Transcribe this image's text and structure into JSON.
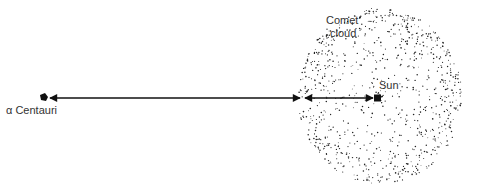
{
  "diagram": {
    "labels": {
      "alpha_centauri": "α Centauri",
      "sun": "Sun",
      "comet_line1": "Comet",
      "comet_line2": "cloud"
    },
    "objects": {
      "alpha_centauri": {
        "x": 44,
        "y": 98
      },
      "sun": {
        "x": 378,
        "y": 98
      },
      "cloud": {
        "cx": 380,
        "cy": 96,
        "rx": 82,
        "ry": 88
      }
    },
    "arrows": [
      {
        "name": "centauri-to-cloud",
        "from": [
          50,
          98
        ],
        "to": [
          300,
          98
        ],
        "heads": "both"
      },
      {
        "name": "cloud-to-sun",
        "from": [
          305,
          98
        ],
        "to": [
          374,
          98
        ],
        "heads": "both"
      }
    ],
    "colors": {
      "ink": "#111111",
      "text": "#333333",
      "background": "#ffffff"
    }
  }
}
